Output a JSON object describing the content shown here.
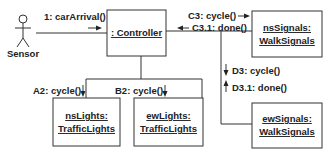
{
  "diagram": {
    "type": "UML communication diagram",
    "actor": {
      "name": "Sensor"
    },
    "objects": {
      "controller": {
        "line1": ": Controller"
      },
      "ns_signals": {
        "line1": "nsSignals:",
        "line2": "WalkSignals"
      },
      "ew_signals": {
        "line1": "ewSignals:",
        "line2": "WalkSignals"
      },
      "ns_lights": {
        "line1": "nsLights:",
        "line2": "TrafficLights"
      },
      "ew_lights": {
        "line1": "ewLights:",
        "line2": "TrafficLights"
      }
    },
    "messages": {
      "car_arrival": "1: carArrival()",
      "c3_cycle": "C3: cycle()",
      "c31_done": "C3.1: done()",
      "d3_cycle": "D3: cycle()",
      "d31_done": "D3.1: done()",
      "a2_cycle": "A2: cycle()",
      "b2_cycle": "B2: cycle()"
    }
  }
}
